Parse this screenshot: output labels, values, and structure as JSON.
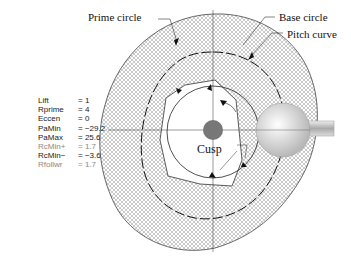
{
  "diagram": {
    "labels": {
      "prime_circle": "Prime circle",
      "base_circle": "Base circle",
      "pitch_curve": "Pitch curve",
      "cusp": "Cusp"
    },
    "parameters": [
      {
        "key": "Lift",
        "eq": "=",
        "value": "1",
        "dim": false
      },
      {
        "key": "Rprime",
        "eq": "=",
        "value": "4",
        "dim": false
      },
      {
        "key": "Eccen",
        "eq": "=",
        "value": "0",
        "dim": false
      },
      {
        "key": "PaMin",
        "eq": "=",
        "value": "−29.2",
        "dim": false
      },
      {
        "key": "PaMax",
        "eq": "=",
        "value": "25.6",
        "dim": false
      },
      {
        "key": "RcMin+",
        "eq": "=",
        "value": "1.7",
        "dim": true
      },
      {
        "key": "RcMin−",
        "eq": "=",
        "value": "−3.6",
        "dim": false
      },
      {
        "key": "Rfollwr",
        "eq": "=",
        "value": "1.7",
        "dim": true
      }
    ],
    "colors": {
      "mesh": "#555555",
      "hub": "#777777",
      "follower": "#d8d8d8"
    }
  }
}
